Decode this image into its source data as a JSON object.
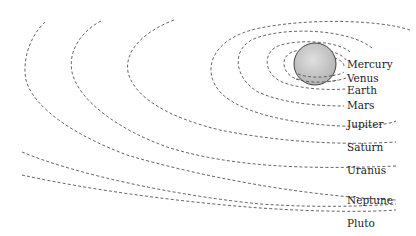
{
  "diagram": {
    "title": "",
    "type": "solar-system-orbits",
    "center_body": {
      "name": "Sun",
      "color": "#c8c8c8",
      "stroke": "#444444"
    },
    "planets": [
      {
        "name": "Mercury",
        "label": "Mercury",
        "label_x": 347,
        "label_y": 68
      },
      {
        "name": "Venus",
        "label": "Venus",
        "label_x": 347,
        "label_y": 82
      },
      {
        "name": "Earth",
        "label": "Earth",
        "label_x": 347,
        "label_y": 94
      },
      {
        "name": "Mars",
        "label": "Mars",
        "label_x": 347,
        "label_y": 109
      },
      {
        "name": "Jupiter",
        "label": "Jupiter",
        "label_x": 347,
        "label_y": 128
      },
      {
        "name": "Saturn",
        "label": "Saturn",
        "label_x": 347,
        "label_y": 151
      },
      {
        "name": "Uranus",
        "label": "Uranus",
        "label_x": 347,
        "label_y": 174
      },
      {
        "name": "Neptune",
        "label": "Neptune",
        "label_x": 347,
        "label_y": 204
      },
      {
        "name": "Pluto",
        "label": "Pluto",
        "label_x": 347,
        "label_y": 227
      }
    ],
    "orbit_style": {
      "stroke": "#555555",
      "dash": "dashed"
    }
  }
}
